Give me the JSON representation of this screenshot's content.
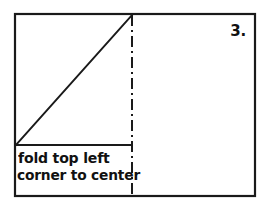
{
  "figure": {
    "step_number": "3.",
    "caption_line_1": "fold top left",
    "caption_line_2": "corner to center",
    "colors": {
      "ink": "#1a1a1a",
      "paper": "#ffffff"
    },
    "elements": {
      "outer_frame": "paper-sheet-outline",
      "diagonal": "fold-diagonal-line",
      "center_line": "vertical-center-dash-dot-line",
      "caption_divider": "caption-divider-line"
    }
  }
}
